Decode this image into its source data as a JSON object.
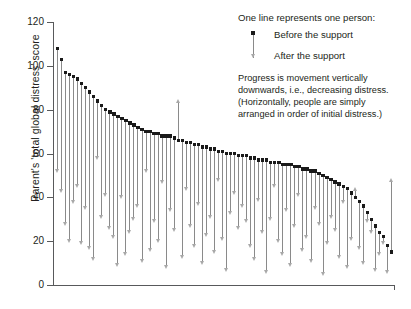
{
  "chart_data": {
    "type": "scatter",
    "title": "",
    "xlabel": "",
    "ylabel": "Parent's 'total global distress' score",
    "ylim": [
      0,
      120
    ],
    "yticks": [
      0,
      20,
      40,
      60,
      80,
      100,
      120
    ],
    "grid": false,
    "legend_position": "top-right",
    "series": [
      {
        "name": "Before the support",
        "marker": "square",
        "color": "#1a1a1a"
      },
      {
        "name": "After the support",
        "marker": "triangle",
        "color": "#a8a8a8"
      }
    ],
    "categories": [
      "1",
      "2",
      "3",
      "4",
      "5",
      "6",
      "7",
      "8",
      "9",
      "10",
      "11",
      "12",
      "13",
      "14",
      "15",
      "16",
      "17",
      "18",
      "19",
      "20",
      "21",
      "22",
      "23",
      "24",
      "25",
      "26",
      "27",
      "28",
      "29",
      "30",
      "31",
      "32",
      "33",
      "34",
      "35",
      "36",
      "37",
      "38",
      "39",
      "40",
      "41",
      "42",
      "43",
      "44",
      "45",
      "46",
      "47",
      "48",
      "49",
      "50",
      "51",
      "52",
      "53",
      "54",
      "55",
      "56",
      "57",
      "58",
      "59",
      "60",
      "61",
      "62",
      "63",
      "64",
      "65",
      "66",
      "67",
      "68",
      "69",
      "70",
      "71",
      "72",
      "73",
      "74",
      "75",
      "76",
      "77",
      "78",
      "79",
      "80",
      "81",
      "82",
      "83",
      "84"
    ],
    "before": [
      108,
      103,
      97,
      96,
      95,
      94,
      92,
      90,
      88,
      86,
      84,
      82,
      80,
      79,
      78,
      77,
      76,
      75,
      74,
      73,
      72,
      71,
      70,
      70,
      69,
      69,
      68,
      68,
      68,
      67,
      66,
      66,
      65,
      65,
      64,
      64,
      63,
      63,
      62,
      62,
      61,
      61,
      60,
      60,
      60,
      59,
      59,
      59,
      58,
      58,
      57,
      57,
      57,
      56,
      56,
      56,
      55,
      55,
      55,
      54,
      54,
      53,
      53,
      52,
      52,
      51,
      50,
      49,
      48,
      47,
      46,
      45,
      44,
      42,
      40,
      38,
      36,
      33,
      30,
      27,
      24,
      22,
      18,
      15
    ],
    "after": [
      52,
      43,
      28,
      20,
      38,
      45,
      19,
      35,
      17,
      12,
      58,
      31,
      41,
      26,
      22,
      9,
      40,
      14,
      24,
      30,
      36,
      11,
      52,
      16,
      29,
      20,
      47,
      8,
      34,
      25,
      84,
      13,
      44,
      27,
      18,
      37,
      10,
      23,
      31,
      15,
      48,
      21,
      7,
      33,
      42,
      26,
      36,
      29,
      18,
      12,
      39,
      24,
      6,
      30,
      45,
      20,
      14,
      34,
      9,
      27,
      41,
      16,
      22,
      11,
      35,
      28,
      5,
      19,
      31,
      25,
      13,
      38,
      8,
      21,
      44,
      17,
      10,
      29,
      24,
      7,
      14,
      19,
      6,
      48
    ],
    "annotations": [
      "One line represents one person:",
      "Progress is movement vertically downwards, i.e., decreasing distress. (Horizontally, people are simply arranged in order of initial distress.)"
    ]
  },
  "legend": {
    "title": "One line represents one person:",
    "before_label": "Before the support",
    "after_label": "After the support",
    "note_lines": [
      "Progress is movement vertically",
      "downwards, i.e., decreasing distress.",
      "(Horizontally, people are simply",
      "arranged in order of initial distress.)"
    ]
  },
  "axis": {
    "y_title": "Parent's 'total global distress' score",
    "y_labels": [
      "120",
      "100",
      "80",
      "60",
      "40",
      "20",
      "0"
    ]
  }
}
